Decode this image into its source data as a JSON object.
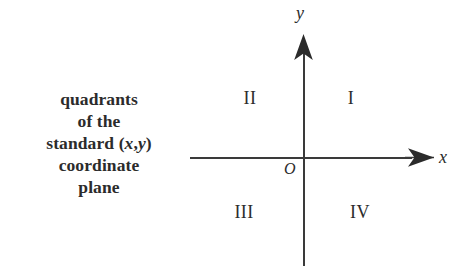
{
  "figure": {
    "background_color": "#ffffff",
    "ink_color": "#2b2b2b",
    "caption": {
      "lines": [
        "quadrants",
        "of the",
        "standard (x,y)",
        "coordinate",
        "plane"
      ],
      "line_1": "quadrants",
      "line_2": "of the",
      "line_3_prefix": "standard (",
      "line_3_var_x": "x",
      "line_3_comma": ",",
      "line_3_var_y": "y",
      "line_3_suffix": ")",
      "line_4": "coordinate",
      "line_5": "plane"
    },
    "axes": {
      "x_label": "x",
      "y_label": "y",
      "origin_label": "O",
      "x_axis_name": "horizontal axis",
      "y_axis_name": "vertical axis"
    },
    "quadrants": [
      {
        "id": "I",
        "label": "I",
        "position": "upper-right"
      },
      {
        "id": "II",
        "label": "II",
        "position": "upper-left"
      },
      {
        "id": "III",
        "label": "III",
        "position": "lower-left"
      },
      {
        "id": "IV",
        "label": "IV",
        "position": "lower-right"
      }
    ]
  }
}
